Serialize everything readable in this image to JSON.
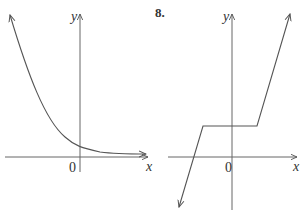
{
  "graphs": [
    {
      "id": "left",
      "number": "",
      "y_axis_label": "y",
      "x_axis_label": "x",
      "origin_label": "0",
      "description": "decreasing curve approaching x-axis asymptotically, positive y-intercept"
    },
    {
      "id": "right",
      "number": "8.",
      "y_axis_label": "y",
      "x_axis_label": "x",
      "origin_label": "0",
      "description": "piecewise linear: rising line, horizontal segment above x-axis, rising line"
    }
  ],
  "colors": {
    "line": "#555555",
    "text": "#333333"
  }
}
